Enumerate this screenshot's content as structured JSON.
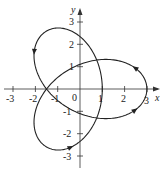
{
  "figure": {
    "type": "parametric-curve",
    "x_axis_label": "x",
    "y_axis_label": "y",
    "x_ticks": [
      "-3",
      "-2",
      "-1",
      "0",
      "1",
      "2",
      "3"
    ],
    "y_ticks": [
      "3",
      "2",
      "1",
      "-1",
      "-2",
      "-3"
    ],
    "origin_label": "0",
    "colors": {
      "curve": "#222222",
      "axis": "#333333",
      "background": "#ffffff"
    },
    "arrows": 4
  },
  "chart_data": {
    "type": "line",
    "title": "",
    "xlabel": "x",
    "ylabel": "y",
    "xlim": [
      -3.5,
      3.5
    ],
    "ylim": [
      -3.5,
      3.5
    ],
    "x_ticks": [
      -3,
      -2,
      -1,
      0,
      1,
      2,
      3
    ],
    "y_ticks": [
      -3,
      -2,
      -1,
      1,
      2,
      3
    ],
    "grid": false,
    "series": [
      {
        "name": "closed parametric curve",
        "key_points": [
          {
            "x": 3,
            "y": 0,
            "note": "right lobe tip"
          },
          {
            "x": -1.5,
            "y": 2.6,
            "note": "upper-left lobe tip"
          },
          {
            "x": -1.5,
            "y": -2.6,
            "note": "lower-left lobe tip"
          },
          {
            "x": -2,
            "y": 0,
            "note": "self-intersection"
          },
          {
            "x": 1,
            "y": 1.7,
            "note": "self-intersection"
          },
          {
            "x": 1,
            "y": -1.7,
            "note": "self-intersection"
          }
        ]
      }
    ]
  }
}
